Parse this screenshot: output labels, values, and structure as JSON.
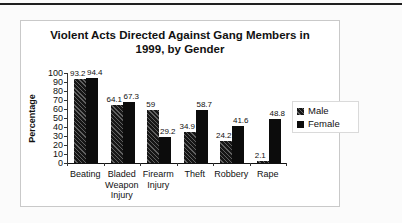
{
  "page": {
    "background": "#fbfbfb"
  },
  "divider": {
    "color": "#1f1f1f"
  },
  "chart_data": {
    "type": "bar",
    "title": "Violent Acts Directed Against Gang Members in 1999, by Gender",
    "title_lines": [
      "Violent Acts Directed Against Gang Members in",
      "1999, by Gender"
    ],
    "ylabel": "Percentage",
    "ylim": [
      0,
      100
    ],
    "ytick_step": 10,
    "yticks": [
      0,
      10,
      20,
      30,
      40,
      50,
      60,
      70,
      80,
      90,
      100
    ],
    "categories": [
      "Beating",
      "Bladed Weapon Injury",
      "Firearm Injury",
      "Theft",
      "Robbery",
      "Rape"
    ],
    "series": [
      {
        "name": "Male",
        "values": [
          93.2,
          64.1,
          59,
          34.9,
          24.2,
          2.1
        ],
        "fill": "hatched",
        "color": "#161616",
        "hatch_color": "#606060"
      },
      {
        "name": "Female",
        "values": [
          94.4,
          67.3,
          29.2,
          58.7,
          41.6,
          48.8
        ],
        "fill": "solid",
        "color": "#0c0c0c"
      }
    ],
    "show_data_labels": true,
    "legend_position": "right",
    "grid": false,
    "axis_color": "#333333"
  }
}
